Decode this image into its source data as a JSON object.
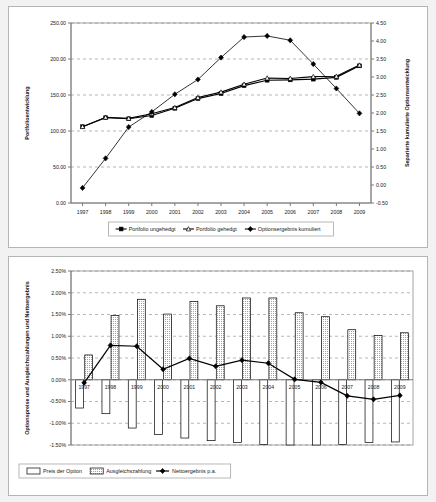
{
  "chart_data": [
    {
      "type": "line",
      "id": "portfolio-development",
      "title": "",
      "xlabel": "",
      "ylabel": "Portfolioentwicklung",
      "y2label": "Separierte kumulierte Optionsentwicklung",
      "categories": [
        "1997",
        "1998",
        "1999",
        "2000",
        "2001",
        "2002",
        "2003",
        "2004",
        "2005",
        "2006",
        "2007",
        "2008",
        "2009"
      ],
      "ylim": [
        0.0,
        250.0
      ],
      "ytick_step": 50.0,
      "ytick_labels": [
        "0.00",
        "50.00",
        "100.00",
        "150.00",
        "200.00",
        "250.00"
      ],
      "y2lim": [
        -0.5,
        4.5
      ],
      "y2tick_step": 0.5,
      "y2tick_labels": [
        "-0.50",
        "0.00",
        "0.50",
        "1.00",
        "1.50",
        "2.00",
        "2.50",
        "3.00",
        "3.50",
        "4.00",
        "4.50"
      ],
      "grid": true,
      "legend_position": "bottom",
      "series": [
        {
          "name": "Portfolio ungehedgt",
          "axis": "left",
          "marker": "filled-square",
          "values": [
            106.0,
            118.5,
            117.0,
            121.5,
            131.5,
            145.0,
            152.0,
            163.0,
            170.5,
            171.0,
            172.0,
            174.5,
            190.5
          ]
        },
        {
          "name": "Portfolio gehedgt",
          "axis": "left",
          "marker": "open-triangle",
          "values": [
            106.0,
            119.0,
            117.5,
            124.0,
            132.5,
            146.5,
            154.0,
            165.0,
            173.5,
            173.0,
            175.5,
            176.0,
            191.5
          ]
        },
        {
          "name": "Optionsergebnis kumuliert",
          "axis": "right",
          "marker": "filled-diamond",
          "values": [
            -0.08,
            0.74,
            1.61,
            2.03,
            2.52,
            2.93,
            3.54,
            4.11,
            4.14,
            4.02,
            3.36,
            2.68,
            1.99
          ]
        }
      ]
    },
    {
      "type": "bar",
      "id": "option-costs-and-payouts",
      "title": "",
      "xlabel": "",
      "ylabel": "Optionspreise und Ausgleichszahlungen und Nettoergebnis",
      "categories": [
        "1997",
        "1998",
        "1999",
        "2000",
        "2001",
        "2002",
        "2003",
        "2004",
        "2005",
        "2006",
        "2007",
        "2008",
        "2009"
      ],
      "ylim": [
        -1.5,
        2.5
      ],
      "ytick_step": 0.5,
      "ytick_labels": [
        "-1.50%",
        "-1.00%",
        "-0.50%",
        "0.00%",
        "0.50%",
        "1.00%",
        "1.50%",
        "2.00%",
        "2.50%"
      ],
      "grid": true,
      "legend_position": "bottom",
      "series": [
        {
          "name": "Preis der Option",
          "type": "bar",
          "fill": "hollow",
          "values": [
            -0.65,
            -0.78,
            -1.11,
            -1.26,
            -1.34,
            -1.4,
            -1.44,
            -1.49,
            -1.5,
            -1.5,
            -1.49,
            -1.44,
            -1.43
          ]
        },
        {
          "name": "Ausgleichszahlung",
          "type": "bar",
          "fill": "dotted",
          "values": [
            0.57,
            1.48,
            1.85,
            1.51,
            1.8,
            1.7,
            1.88,
            1.88,
            1.54,
            1.45,
            1.15,
            1.02,
            1.08
          ]
        },
        {
          "name": "Nettoergebnis p.a.",
          "type": "line",
          "marker": "filled-diamond",
          "values": [
            -0.07,
            0.79,
            0.77,
            0.24,
            0.49,
            0.31,
            0.45,
            0.38,
            0.01,
            -0.06,
            -0.37,
            -0.45,
            -0.36
          ]
        }
      ]
    }
  ],
  "colors": {
    "panel_background": "#ffffff",
    "page_background": "#f2f2f2",
    "axis": "#7a7a7a",
    "grid": "#9a9a9a",
    "series": "#000000"
  }
}
